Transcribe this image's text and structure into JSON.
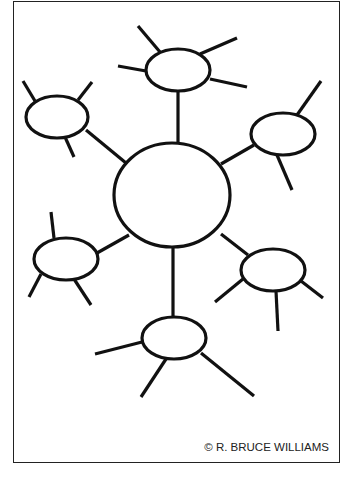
{
  "diagram": {
    "type": "spider-web graphic organizer",
    "stroke_color": "#111111",
    "frame_color": "#222222",
    "background": "#ffffff",
    "center": {
      "cx": 172,
      "cy": 195,
      "rx": 58,
      "ry": 52
    },
    "nodes": [
      {
        "id": "top",
        "cx": 178,
        "cy": 70,
        "rx": 32,
        "ry": 21,
        "connector": [
          178,
          91,
          178,
          143
        ],
        "legs": [
          [
            160,
            52,
            138,
            26
          ],
          [
            146,
            71,
            118,
            66
          ],
          [
            200,
            54,
            237,
            38
          ],
          [
            210,
            79,
            247,
            87
          ]
        ]
      },
      {
        "id": "top-left",
        "cx": 57,
        "cy": 117,
        "rx": 31,
        "ry": 21,
        "connector": [
          86,
          130,
          126,
          163
        ],
        "legs": [
          [
            35,
            101,
            23,
            81
          ],
          [
            78,
            100,
            92,
            82
          ],
          [
            65,
            137,
            74,
            157
          ]
        ]
      },
      {
        "id": "top-right",
        "cx": 283,
        "cy": 134,
        "rx": 32,
        "ry": 21,
        "connector": [
          254,
          145,
          221,
          164
        ],
        "legs": [
          [
            297,
            115,
            321,
            81
          ],
          [
            277,
            155,
            292,
            190
          ]
        ]
      },
      {
        "id": "bottom-left",
        "cx": 66,
        "cy": 259,
        "rx": 32,
        "ry": 21,
        "connector": [
          97,
          253,
          129,
          235
        ],
        "legs": [
          [
            54,
            238,
            51,
            212
          ],
          [
            41,
            274,
            29,
            297
          ],
          [
            74,
            279,
            91,
            305
          ]
        ]
      },
      {
        "id": "bottom-right",
        "cx": 273,
        "cy": 270,
        "rx": 32,
        "ry": 21,
        "connector": [
          248,
          255,
          221,
          234
        ],
        "legs": [
          [
            243,
            279,
            215,
            302
          ],
          [
            276,
            291,
            278,
            331
          ],
          [
            301,
            281,
            323,
            298
          ]
        ]
      },
      {
        "id": "bottom",
        "cx": 174,
        "cy": 338,
        "rx": 32,
        "ry": 21,
        "connector": [
          173,
          317,
          173,
          247
        ],
        "legs": [
          [
            142,
            342,
            95,
            354
          ],
          [
            166,
            359,
            141,
            397
          ],
          [
            201,
            353,
            254,
            396
          ]
        ]
      }
    ]
  },
  "credit": "© R. BRUCE WILLIAMS"
}
